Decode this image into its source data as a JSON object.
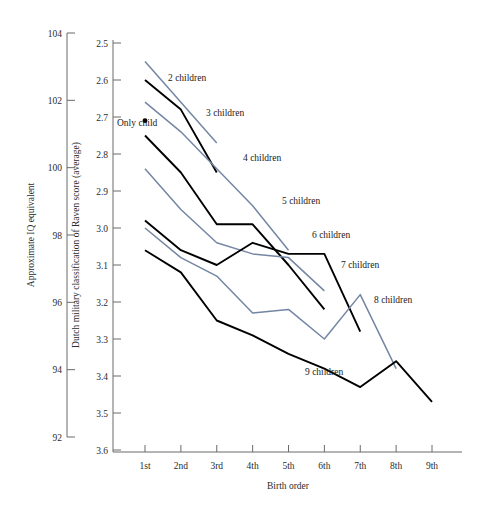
{
  "chart_data": {
    "type": "line",
    "title": "",
    "xlabel": "Birth order",
    "ylabel_left": "Approximate IQ equivalent",
    "ylabel_right": "Dutch military classification of Raven score (average)",
    "x_categories": [
      "1st",
      "2nd",
      "3rd",
      "4th",
      "5th",
      "6th",
      "7th",
      "8th",
      "9th"
    ],
    "x_values": [
      1,
      2,
      3,
      4,
      5,
      6,
      7,
      8,
      9
    ],
    "y_left_axis": {
      "label": "Approximate IQ equivalent",
      "ticks": [
        104,
        102,
        100,
        98,
        96,
        94,
        92
      ],
      "ylim": [
        92,
        104
      ],
      "direction": "descending"
    },
    "y_right_axis": {
      "label": "Dutch military classification of Raven score (average)",
      "ticks": [
        2.5,
        2.6,
        2.7,
        2.8,
        2.9,
        3.0,
        3.1,
        3.2,
        3.3,
        3.4,
        3.5,
        3.6
      ],
      "ylim": [
        2.5,
        3.6
      ],
      "direction": "inverted",
      "note": "Lower Raven score = higher IQ"
    },
    "grid": false,
    "legend": "inline-labels",
    "colors": {
      "black": "#000000",
      "blue_gray": "#7486a3"
    },
    "series": [
      {
        "name": "Only child",
        "label": "Only child",
        "color": "#000000",
        "marker": "dot",
        "x": [
          1
        ],
        "values": [
          2.71
        ]
      },
      {
        "name": "2 children",
        "label": "2 children",
        "color": "#7486a3",
        "x": [
          1,
          2,
          3
        ],
        "values": [
          2.55,
          2.66,
          2.77
        ]
      },
      {
        "name": "3 children",
        "label": "3 children",
        "color": "#000000",
        "x": [
          1,
          2,
          3
        ],
        "values": [
          2.6,
          2.68,
          2.85
        ]
      },
      {
        "name": "4 children",
        "label": "4 children",
        "color": "#7486a3",
        "x": [
          1,
          2,
          3,
          4,
          5
        ],
        "values": [
          2.66,
          2.74,
          2.84,
          2.94,
          3.06
        ]
      },
      {
        "name": "5 children",
        "label": "5 children",
        "color": "#000000",
        "x": [
          1,
          2,
          3,
          4,
          5,
          6
        ],
        "values": [
          2.75,
          2.85,
          2.99,
          2.99,
          3.1,
          3.22
        ]
      },
      {
        "name": "6 children",
        "label": "6 children",
        "color": "#7486a3",
        "x": [
          1,
          2,
          3,
          4,
          5,
          6
        ],
        "values": [
          2.84,
          2.95,
          3.04,
          3.07,
          3.08,
          3.17
        ]
      },
      {
        "name": "7 children",
        "label": "7 children",
        "color": "#000000",
        "x": [
          1,
          2,
          3,
          4,
          5,
          6,
          7
        ],
        "values": [
          2.98,
          3.06,
          3.1,
          3.04,
          3.07,
          3.07,
          3.28
        ]
      },
      {
        "name": "8 children",
        "label": "8 children",
        "color": "#7486a3",
        "x": [
          1,
          2,
          3,
          4,
          5,
          6,
          7,
          8
        ],
        "values": [
          3.0,
          3.08,
          3.13,
          3.23,
          3.22,
          3.3,
          3.18,
          3.38
        ]
      },
      {
        "name": "9 children",
        "label": "9 children",
        "color": "#000000",
        "x": [
          1,
          2,
          3,
          4,
          5,
          6,
          7,
          8,
          9
        ],
        "values": [
          3.06,
          3.12,
          3.25,
          3.29,
          3.34,
          3.38,
          3.43,
          3.36,
          3.47
        ]
      }
    ],
    "annotations": [
      {
        "text": "2 children",
        "x_px": 168,
        "y_px": 81
      },
      {
        "text": "3 children",
        "x_px": 206,
        "y_px": 116
      },
      {
        "text": "Only child",
        "x_px": 117,
        "y_px": 126
      },
      {
        "text": "4 children",
        "x_px": 243,
        "y_px": 161
      },
      {
        "text": "5 children",
        "x_px": 282,
        "y_px": 204
      },
      {
        "text": "6 children",
        "x_px": 312,
        "y_px": 238
      },
      {
        "text": "7 children",
        "x_px": 341,
        "y_px": 268
      },
      {
        "text": "8 children",
        "x_px": 374,
        "y_px": 303
      },
      {
        "text": "9 children",
        "x_px": 305,
        "y_px": 375
      }
    ]
  }
}
